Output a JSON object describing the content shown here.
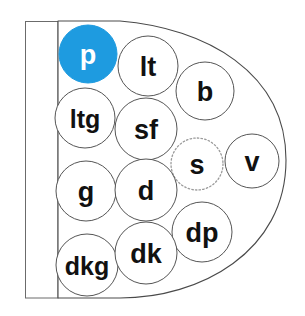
{
  "figure": {
    "background_color": "#ffffff",
    "outline_color": "#4a4a4a",
    "circle_stroke_color": "#555555",
    "highlight_fill": "#1e9be0",
    "highlight_text_color": "#ffffff",
    "default_fill": "#ffffff",
    "default_text_color": "#111111",
    "dashed_stroke_color": "#9a9a9a"
  },
  "shapes": {
    "left_bar": {
      "name": "left-rectangle",
      "x": 25,
      "y": 21,
      "width": 33,
      "height": 277,
      "fill": "#ffffff",
      "stroke": "#6b6b6b"
    },
    "dome": {
      "name": "dome-outline",
      "left_edge_x": 58,
      "top_y": 21,
      "bottom_y": 298,
      "right_extent_x": 286,
      "fill": "#ffffff",
      "stroke": "#4a4a4a"
    }
  },
  "nodes": [
    {
      "id": "p",
      "label": "p",
      "cx": 88,
      "cy": 54,
      "r": 29,
      "state": "selected",
      "border": "solid"
    },
    {
      "id": "lt",
      "label": "lt",
      "cx": 148,
      "cy": 66,
      "r": 30,
      "state": "normal",
      "border": "solid"
    },
    {
      "id": "b",
      "label": "b",
      "cx": 205,
      "cy": 91,
      "r": 29,
      "state": "normal",
      "border": "solid"
    },
    {
      "id": "ltg",
      "label": "ltg",
      "cx": 85,
      "cy": 118,
      "r": 30,
      "state": "normal",
      "border": "solid"
    },
    {
      "id": "sf",
      "label": "sf",
      "cx": 146,
      "cy": 129,
      "r": 31,
      "state": "normal",
      "border": "solid"
    },
    {
      "id": "s",
      "label": "s",
      "cx": 197,
      "cy": 164,
      "r": 26,
      "state": "pending",
      "border": "dotted"
    },
    {
      "id": "v",
      "label": "v",
      "cx": 252,
      "cy": 161,
      "r": 27,
      "state": "normal",
      "border": "solid"
    },
    {
      "id": "g",
      "label": "g",
      "cx": 86,
      "cy": 191,
      "r": 30,
      "state": "normal",
      "border": "solid"
    },
    {
      "id": "d",
      "label": "d",
      "cx": 146,
      "cy": 190,
      "r": 31,
      "state": "normal",
      "border": "solid"
    },
    {
      "id": "dp",
      "label": "dp",
      "cx": 202,
      "cy": 232,
      "r": 30,
      "state": "normal",
      "border": "solid"
    },
    {
      "id": "dkg",
      "label": "dkg",
      "cx": 87,
      "cy": 265,
      "r": 31,
      "state": "normal",
      "border": "solid"
    },
    {
      "id": "dk",
      "label": "dk",
      "cx": 146,
      "cy": 253,
      "r": 31,
      "state": "normal",
      "border": "solid"
    }
  ],
  "legend": {
    "selected_node_id": "p",
    "pending_node_id": "s",
    "node_count": 12
  }
}
